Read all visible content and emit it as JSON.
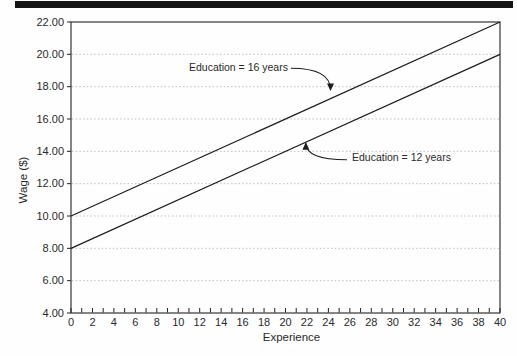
{
  "page": {
    "background": "#fefefe",
    "top_rule_color": "#141414"
  },
  "chart_data": {
    "type": "line",
    "title": "",
    "xlabel": "Experience",
    "ylabel": "Wage ($)",
    "xlim": [
      0,
      40
    ],
    "ylim": [
      4,
      22
    ],
    "x_tick_step": 2,
    "x_minor_tick_step": 1,
    "y_tick_step": 2,
    "y_tick_decimals": 2,
    "grid": "horizontal-dotted",
    "legend_position": "inline-annotations",
    "series": [
      {
        "name": "Education = 16 years",
        "x": [
          0,
          40
        ],
        "values": [
          10,
          22
        ]
      },
      {
        "name": "Education = 12 years",
        "x": [
          0,
          40
        ],
        "values": [
          8,
          20
        ]
      }
    ],
    "annotations": [
      {
        "text": "Education = 16 years",
        "label_xy": [
          11.0,
          19.2
        ],
        "target_xy": [
          24.2,
          17.8
        ],
        "attach": "end"
      },
      {
        "text": "Education = 12 years",
        "label_xy": [
          26.2,
          13.6
        ],
        "target_xy": [
          21.9,
          14.5
        ],
        "attach": "start"
      }
    ],
    "colors": {
      "axis": "#222222",
      "line": "#1d1d1d",
      "grid": "#b9b9b9",
      "text": "#2a2a2a"
    }
  }
}
